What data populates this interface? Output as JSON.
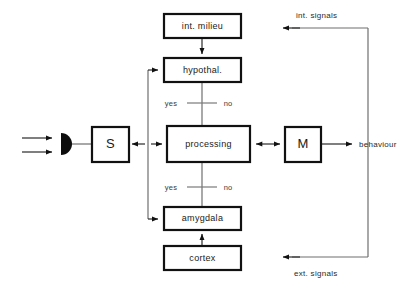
{
  "diagram": {
    "colors": {
      "box_stroke": "#111111",
      "box_fill": "#ffffff",
      "connector": "#6f6f6f",
      "arrow": "#111111",
      "text": "#1a1a1a"
    },
    "boxes": [
      {
        "id": "int_milieu",
        "label": "int. milieu",
        "x": 164,
        "y": 14,
        "w": 77,
        "h": 24,
        "size": "small"
      },
      {
        "id": "hypothal",
        "label": "hypothal.",
        "x": 164,
        "y": 58,
        "w": 77,
        "h": 24,
        "size": "small"
      },
      {
        "id": "sensor",
        "label": "S",
        "x": 92,
        "y": 127,
        "w": 37,
        "h": 35,
        "size": "big"
      },
      {
        "id": "processing",
        "label": "processing",
        "x": 167,
        "y": 126,
        "w": 83,
        "h": 36,
        "size": "small"
      },
      {
        "id": "motor",
        "label": "M",
        "x": 285,
        "y": 127,
        "w": 36,
        "h": 35,
        "size": "big"
      },
      {
        "id": "amygdala",
        "label": "amygdala",
        "x": 164,
        "y": 207,
        "w": 77,
        "h": 23,
        "size": "small"
      },
      {
        "id": "cortex",
        "label": "cortex",
        "x": 164,
        "y": 246,
        "w": 77,
        "h": 24,
        "size": "small"
      }
    ],
    "edge_labels": [
      {
        "id": "behaviour",
        "text": "behaviour",
        "x": 362,
        "y": 147
      },
      {
        "id": "int_signals",
        "text": "int. signals",
        "x": 296,
        "y": 15
      },
      {
        "id": "ext_signals",
        "text": "ext. signals",
        "x": 294,
        "y": 274
      }
    ],
    "decision_labels": [
      {
        "id": "hypothal_yes",
        "text": "yes",
        "x": 171,
        "y": 106
      },
      {
        "id": "hypothal_no",
        "text": "no",
        "x": 227,
        "y": 106
      },
      {
        "id": "amygdala_yes",
        "text": "yes",
        "x": 171,
        "y": 190
      },
      {
        "id": "amygdala_no",
        "text": "no",
        "x": 227,
        "y": 190
      }
    ],
    "inputs": [
      {
        "id": "input_arrow_upper",
        "y": 138
      },
      {
        "id": "input_arrow_lower",
        "y": 152
      }
    ]
  }
}
